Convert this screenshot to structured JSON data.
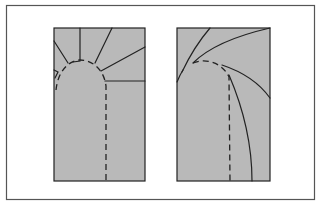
{
  "figure": {
    "colors": {
      "background": "#ffffff",
      "frame": "#555555",
      "panel_fill": "#b9b9b9",
      "line": "#222222"
    },
    "panels": [
      {
        "id": "left",
        "style": "straight-radial-lines"
      },
      {
        "id": "right",
        "style": "curved-lines"
      }
    ]
  }
}
